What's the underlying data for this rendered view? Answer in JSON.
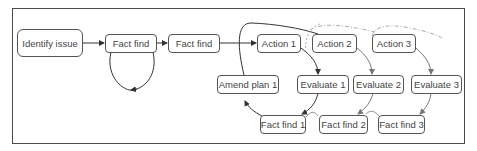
{
  "diagram": {
    "type": "process-flow",
    "nodes": [
      {
        "id": "identify",
        "label": "Identify issue"
      },
      {
        "id": "factfind_a",
        "label": "Fact find"
      },
      {
        "id": "factfind_b",
        "label": "Fact find"
      },
      {
        "id": "action1",
        "label": "Action 1"
      },
      {
        "id": "action2",
        "label": "Action 2"
      },
      {
        "id": "action3",
        "label": "Action 3"
      },
      {
        "id": "amend1",
        "label": "Amend plan 1"
      },
      {
        "id": "evaluate1",
        "label": "Evaluate 1"
      },
      {
        "id": "evaluate2",
        "label": "Evaluate 2"
      },
      {
        "id": "evaluate3",
        "label": "Evaluate 3"
      },
      {
        "id": "factfind1",
        "label": "Fact find 1"
      },
      {
        "id": "factfind2",
        "label": "Fact find 2"
      },
      {
        "id": "factfind3",
        "label": "Fact find 3"
      }
    ],
    "edges": [
      {
        "from": "identify",
        "to": "factfind_a"
      },
      {
        "from": "factfind_a",
        "to": "factfind_a",
        "style": "loop"
      },
      {
        "from": "factfind_a",
        "to": "factfind_b"
      },
      {
        "from": "factfind_b",
        "to": "action1"
      },
      {
        "from": "action1",
        "to": "evaluate1"
      },
      {
        "from": "evaluate1",
        "to": "factfind1"
      },
      {
        "from": "factfind1",
        "to": "amend1"
      },
      {
        "from": "amend1",
        "to": "action2"
      },
      {
        "from": "action2",
        "to": "evaluate2"
      },
      {
        "from": "evaluate2",
        "to": "factfind2"
      },
      {
        "from": "factfind2",
        "to": "action3",
        "style": "dashed"
      },
      {
        "from": "action3",
        "to": "evaluate3"
      },
      {
        "from": "evaluate3",
        "to": "factfind3"
      },
      {
        "from": "factfind3",
        "to": "next",
        "style": "dashed"
      }
    ]
  },
  "colors": {
    "line": "#333333",
    "line_light": "#888888",
    "dashed": "#aaaaaa",
    "node_border": "#555555",
    "text": "#444444"
  }
}
